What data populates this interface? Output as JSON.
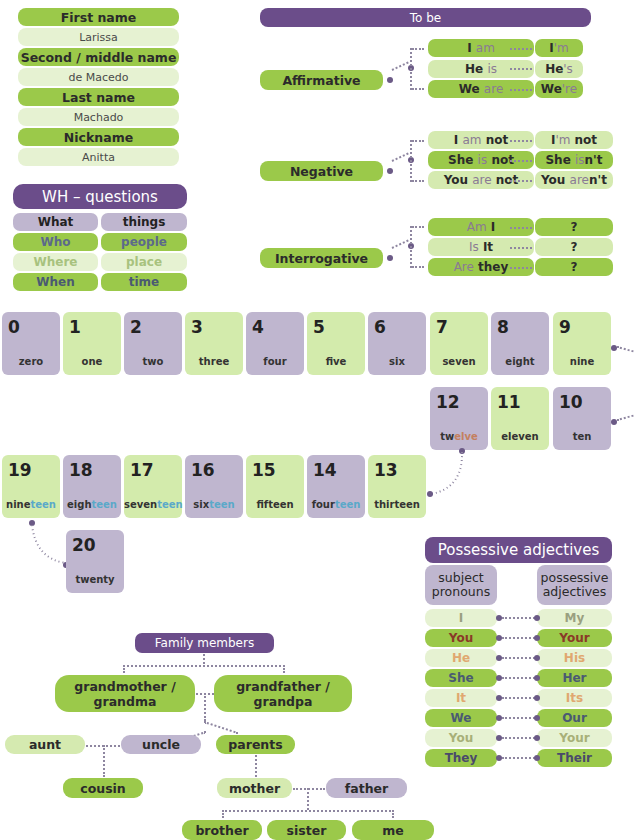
{
  "names": {
    "rows": [
      {
        "label": "First name",
        "value": "Larissa"
      },
      {
        "label": "Second / middle name",
        "value": "de Macedo"
      },
      {
        "label": "Last name",
        "value": "Machado"
      },
      {
        "label": "Nickname",
        "value": "Anitta"
      }
    ]
  },
  "wh": {
    "title": "WH – questions",
    "rows": [
      {
        "q": "What",
        "a": "things"
      },
      {
        "q": "Who",
        "a": "people"
      },
      {
        "q": "Where",
        "a": "place"
      },
      {
        "q": "When",
        "a": "time"
      }
    ]
  },
  "tobe": {
    "title": "To be",
    "groups": [
      {
        "label": "Affirmative",
        "rows": [
          {
            "full_a": "I",
            "full_b": "am",
            "full_c": "",
            "short_a": "I",
            "short_b": "'m",
            "short_c": ""
          },
          {
            "full_a": "He",
            "full_b": "is",
            "full_c": "",
            "short_a": "He",
            "short_b": "'s",
            "short_c": ""
          },
          {
            "full_a": "We",
            "full_b": "are",
            "full_c": "",
            "short_a": "We",
            "short_b": "'re",
            "short_c": ""
          }
        ]
      },
      {
        "label": "Negative",
        "rows": [
          {
            "full_a": "I",
            "full_b": "am",
            "full_c": "not",
            "short_a": "I",
            "short_b": "'m",
            "short_c": "not"
          },
          {
            "full_a": "She",
            "full_b": "is",
            "full_c": "not",
            "short_a": "She",
            "short_b": "is",
            "short_c": "n't"
          },
          {
            "full_a": "You",
            "full_b": "are",
            "full_c": "not",
            "short_a": "You",
            "short_b": "are",
            "short_c": "n't"
          }
        ]
      },
      {
        "label": "Interrogative",
        "rows": [
          {
            "full_a": "",
            "full_b": "Am",
            "full_c": "I",
            "short_a": "?",
            "short_b": "",
            "short_c": ""
          },
          {
            "full_a": "",
            "full_b": "Is",
            "full_c": "It",
            "short_a": "?",
            "short_b": "",
            "short_c": ""
          },
          {
            "full_a": "",
            "full_b": "Are",
            "full_c": "they",
            "short_a": "?",
            "short_b": "",
            "short_c": ""
          }
        ]
      }
    ]
  },
  "numbers": [
    {
      "n": "0",
      "stem": "zero",
      "suffix": ""
    },
    {
      "n": "1",
      "stem": "one",
      "suffix": ""
    },
    {
      "n": "2",
      "stem": "two",
      "suffix": ""
    },
    {
      "n": "3",
      "stem": "three",
      "suffix": ""
    },
    {
      "n": "4",
      "stem": "four",
      "suffix": ""
    },
    {
      "n": "5",
      "stem": "five",
      "suffix": ""
    },
    {
      "n": "6",
      "stem": "six",
      "suffix": ""
    },
    {
      "n": "7",
      "stem": "seven",
      "suffix": ""
    },
    {
      "n": "8",
      "stem": "eight",
      "suffix": ""
    },
    {
      "n": "9",
      "stem": "nine",
      "suffix": ""
    },
    {
      "n": "10",
      "stem": "ten",
      "suffix": ""
    },
    {
      "n": "11",
      "stem": "eleven",
      "suffix": ""
    },
    {
      "n": "12",
      "stem": "tw",
      "suffix": "elve"
    },
    {
      "n": "13",
      "stem": "thirteen",
      "suffix": ""
    },
    {
      "n": "14",
      "stem": "four",
      "suffix": "teen"
    },
    {
      "n": "15",
      "stem": "fifteen",
      "suffix": ""
    },
    {
      "n": "16",
      "stem": "six",
      "suffix": "teen"
    },
    {
      "n": "17",
      "stem": "seven",
      "suffix": "teen"
    },
    {
      "n": "18",
      "stem": "eigh",
      "suffix": "teen"
    },
    {
      "n": "19",
      "stem": "nine",
      "suffix": "teen"
    },
    {
      "n": "20",
      "stem": "twenty",
      "suffix": ""
    }
  ],
  "possessive": {
    "title": "Possessive adjectives",
    "col_left": "subject pronouns",
    "col_right": "possessive adjectives",
    "rows": [
      {
        "subject": "I",
        "adjective": "My"
      },
      {
        "subject": "You",
        "adjective": "Your"
      },
      {
        "subject": "He",
        "adjective": "His"
      },
      {
        "subject": "She",
        "adjective": "Her"
      },
      {
        "subject": "It",
        "adjective": "Its"
      },
      {
        "subject": "We",
        "adjective": "Our"
      },
      {
        "subject": "You",
        "adjective": "Your"
      },
      {
        "subject": "They",
        "adjective": "Their"
      }
    ]
  },
  "family": {
    "title": "Family members",
    "grandmother": "grandmother / grandma",
    "grandfather": "grandfather / grandpa",
    "aunt": "aunt",
    "uncle": "uncle",
    "parents": "parents",
    "cousin": "cousin",
    "mother": "mother",
    "father": "father",
    "brother": "brother",
    "sister": "sister",
    "me": "me"
  },
  "colors": {
    "green_dark": "#9bc94a",
    "green_light": "#d5eab0",
    "purple_dark": "#6b4d8a",
    "purple_light": "#bfb6cf",
    "teen_blue": "#5aa9c9"
  }
}
